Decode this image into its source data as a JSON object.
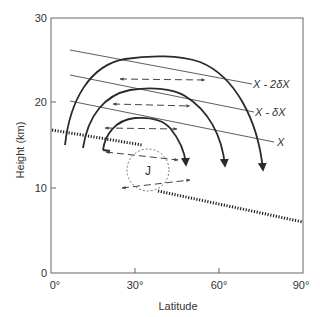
{
  "axes": {
    "x_title": "Latitude",
    "y_title": "Height (km)",
    "x_ticks": [
      "0°",
      "30°",
      "60°",
      "90°"
    ],
    "y_ticks": [
      "0",
      "10",
      "20",
      "30"
    ],
    "x_range": [
      0,
      90
    ],
    "y_range": [
      0,
      30
    ]
  },
  "isentropes": [
    {
      "label": "X - 2δX"
    },
    {
      "label": "X - δX"
    },
    {
      "label": "X"
    }
  ],
  "jet": {
    "label": "J"
  },
  "circulation_cells": 3,
  "mixing_arrows": 5,
  "tropopause": {
    "style": "dotted"
  },
  "colors": {
    "line": "#2a2a2a",
    "axis": "#555555",
    "dashed": "#444444"
  }
}
